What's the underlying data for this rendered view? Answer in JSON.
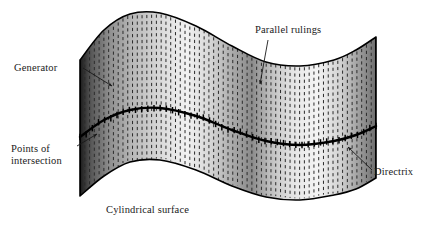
{
  "figure": {
    "title": "Cylindrical surface",
    "width": 432,
    "height": 230,
    "background_color": "#ffffff",
    "ink_color": "#000000"
  },
  "labels": {
    "generator": {
      "text": "Generator",
      "x": 14,
      "y": 71,
      "anchor": "start"
    },
    "parallel_rulings": {
      "text": "Parallel rulings",
      "x": 255,
      "y": 33,
      "anchor": "start"
    },
    "points_of_intersection": {
      "line1": "Points of",
      "line2": "intersection",
      "x": 11,
      "y": 152,
      "anchor": "start"
    },
    "directrix": {
      "text": "Directrix",
      "x": 374,
      "y": 175,
      "anchor": "start"
    },
    "caption": {
      "text": "Cylindrical surface",
      "x": 106,
      "y": 213,
      "anchor": "start"
    }
  },
  "leaders": [
    {
      "name": "generator-leader",
      "from_x": 83,
      "from_y": 68,
      "to_x": 112,
      "to_y": 86,
      "arrow": true
    },
    {
      "name": "parallel-rulings-leader",
      "from_x": 268,
      "from_y": 40,
      "to_x": 260,
      "to_y": 84,
      "arrow": true
    },
    {
      "name": "points-of-intersection-leader",
      "from_x": 77,
      "from_y": 146,
      "to_x": 97,
      "to_y": 134,
      "arrow": true
    },
    {
      "name": "directrix-leader",
      "from_x": 372,
      "from_y": 170,
      "to_x": 348,
      "to_y": 147,
      "arrow": true
    }
  ],
  "surface": {
    "description": "wavy ribbon strip, cylindrical surface with parallel vertical rulings",
    "left_x": 80,
    "right_x": 376,
    "top_curve_points": [
      [
        80,
        60
      ],
      [
        104,
        30
      ],
      [
        130,
        14
      ],
      [
        160,
        13
      ],
      [
        196,
        26
      ],
      [
        232,
        46
      ],
      [
        266,
        62
      ],
      [
        300,
        66
      ],
      [
        334,
        60
      ],
      [
        356,
        50
      ],
      [
        376,
        37
      ]
    ],
    "bottom_curve_points": [
      [
        80,
        196
      ],
      [
        104,
        176
      ],
      [
        130,
        162
      ],
      [
        160,
        160
      ],
      [
        196,
        170
      ],
      [
        232,
        186
      ],
      [
        266,
        197
      ],
      [
        300,
        200
      ],
      [
        334,
        195
      ],
      [
        356,
        189
      ],
      [
        376,
        178
      ]
    ],
    "ruling_count": 62,
    "ruling_dash": "3.2 3.0",
    "ruling_color": "#2b2b2b"
  },
  "directrix_curve": {
    "points": [
      [
        80,
        137
      ],
      [
        104,
        120
      ],
      [
        130,
        110
      ],
      [
        160,
        108
      ],
      [
        196,
        116
      ],
      [
        232,
        130
      ],
      [
        266,
        141
      ],
      [
        300,
        145
      ],
      [
        334,
        141
      ],
      [
        356,
        135
      ],
      [
        376,
        126
      ]
    ],
    "tick_count": 48,
    "tick_half_length": 3.2,
    "stroke_width": 2.4
  },
  "shading": {
    "bands": [
      {
        "offset": 0.0,
        "color": "#1c1c1c"
      },
      {
        "offset": 0.04,
        "color": "#5a5a5a"
      },
      {
        "offset": 0.1,
        "color": "#8f8f8f"
      },
      {
        "offset": 0.18,
        "color": "#b9b9b9"
      },
      {
        "offset": 0.28,
        "color": "#dcdcdc"
      },
      {
        "offset": 0.36,
        "color": "#f2f2f2"
      },
      {
        "offset": 0.44,
        "color": "#d6d6d6"
      },
      {
        "offset": 0.52,
        "color": "#a8a8a8"
      },
      {
        "offset": 0.58,
        "color": "#8a8a8a"
      },
      {
        "offset": 0.64,
        "color": "#bdbdbd"
      },
      {
        "offset": 0.72,
        "color": "#e6e6e6"
      },
      {
        "offset": 0.8,
        "color": "#f4f4f4"
      },
      {
        "offset": 0.88,
        "color": "#d2d2d2"
      },
      {
        "offset": 0.94,
        "color": "#a0a0a0"
      },
      {
        "offset": 1.0,
        "color": "#6e6e6e"
      }
    ]
  }
}
